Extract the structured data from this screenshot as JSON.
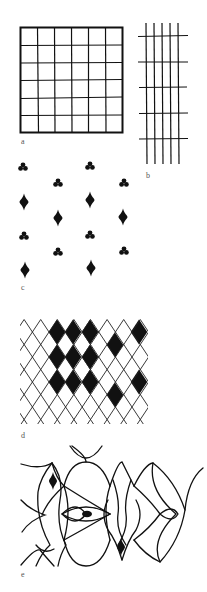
{
  "figure": {
    "panels": [
      {
        "id": "a",
        "label": "a",
        "description": "square grid of 6 x 6 cells with heavy outline"
      },
      {
        "id": "b",
        "label": "b",
        "description": "open grid of 5 vertical and 5 horizontal lines"
      },
      {
        "id": "c",
        "label": "c",
        "description": "half-drop repeat of club and diamond motifs"
      },
      {
        "id": "d",
        "label": "d",
        "description": "diamond lattice with black filled diamonds"
      },
      {
        "id": "e",
        "label": "e",
        "description": "ogee / curvilinear interlaced pattern with small solid motifs"
      }
    ],
    "colors": {
      "ink": "#111111",
      "paper": "#ffffff",
      "label": "#555555"
    },
    "grid_a": {
      "rows": 6,
      "cols": 6
    },
    "grid_b": {
      "vertical_lines": 5,
      "horizontal_lines": 5
    },
    "motifs_c": [
      "club",
      "diamond"
    ],
    "lattice_d": {
      "filled": [
        [
          57,
          332
        ],
        [
          73,
          332
        ],
        [
          90,
          332
        ],
        [
          139,
          332
        ],
        [
          115,
          345
        ],
        [
          57,
          357
        ],
        [
          73,
          357
        ],
        [
          90,
          357
        ],
        [
          57,
          382
        ],
        [
          73,
          382
        ],
        [
          90,
          382
        ],
        [
          139,
          382
        ],
        [
          115,
          395
        ]
      ]
    },
    "motifs_e": [
      "diamond",
      "ellipse",
      "diamond"
    ]
  }
}
